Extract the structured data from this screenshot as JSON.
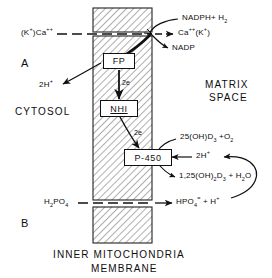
{
  "figure": {
    "panels": [
      {
        "id": "A",
        "label": "A"
      },
      {
        "id": "B",
        "label": "B"
      }
    ],
    "compartments": {
      "left": "CYTOSOL",
      "right_line1": "MATRIX",
      "right_line2": "SPACE"
    },
    "membrane_caption_line1": "INNER MITOCHONDRIA",
    "membrane_caption_line2": "MEMBRANE"
  },
  "boxes": [
    {
      "name": "flavoprotein",
      "label": "FP"
    },
    {
      "name": "non-heme-iron",
      "label": "NHI"
    },
    {
      "name": "cytochrome-p450",
      "label": "P-450"
    }
  ],
  "electron_labels": [
    {
      "name": "fp-to-nhi",
      "label": "2e"
    },
    {
      "name": "nhi-to-p450",
      "label": "2e"
    }
  ],
  "species": {
    "cation_in": {
      "prefix": "(K",
      "prefix_sup": "+",
      "mid": ")Ca",
      "sup": "++"
    },
    "cation_out": {
      "prefix": "Ca",
      "sup": "++",
      "mid": "(K",
      "sup2": "+",
      "suffix": ")"
    },
    "nadph": {
      "text": "NADPH+ H",
      "sub": "2"
    },
    "nadp": {
      "text": "NADP"
    },
    "protons_cytosol": {
      "num": "2H",
      "sup": "+"
    },
    "substrate": {
      "pre": "25(OH)D",
      "sub": "3",
      "post": " +O",
      "sub2": "2"
    },
    "protons_matrix": {
      "num": "2H",
      "sup": "+"
    },
    "product": {
      "pre": "1,25(OH)",
      "sub": "2",
      "mid": "D",
      "sub2": "3",
      "post": " + H",
      "sub3": "2",
      "post2": "O"
    },
    "phosphate_in": {
      "pre": "H",
      "sub": "2",
      "post": "PO",
      "sub2": "4"
    },
    "phosphate_out": {
      "pre": "HPO",
      "sub": "4",
      "sup": "=",
      "post": " + H",
      "sup2": "+"
    }
  },
  "colors": {
    "ink": "#111111",
    "membrane_hatch": "#6f6f6f",
    "background": "#ffffff"
  }
}
